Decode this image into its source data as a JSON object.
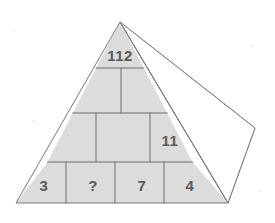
{
  "figure": {
    "type": "number-pyramid",
    "fill_color": "#dcdcdc",
    "line_color": "#6e6e6e",
    "text_color": "#5a5a5a",
    "background_color": "#ffffff"
  },
  "pyramid": {
    "rows": [
      {
        "row_index": 1,
        "name": "apex-row",
        "cells": [
          {
            "id": "r1c1",
            "label": "112"
          }
        ]
      },
      {
        "row_index": 2,
        "name": "second-row",
        "cells": [
          {
            "id": "r2c1",
            "label": ""
          },
          {
            "id": "r2c2",
            "label": ""
          }
        ]
      },
      {
        "row_index": 3,
        "name": "third-row",
        "cells": [
          {
            "id": "r3c1",
            "label": ""
          },
          {
            "id": "r3c2",
            "label": ""
          },
          {
            "id": "r3c3",
            "label": "11"
          }
        ]
      },
      {
        "row_index": 4,
        "name": "base-row",
        "cells": [
          {
            "id": "r4c1",
            "label": "3"
          },
          {
            "id": "r4c2",
            "label": "?"
          },
          {
            "id": "r4c3",
            "label": "7"
          },
          {
            "id": "r4c4",
            "label": "4"
          }
        ]
      }
    ],
    "labels": {
      "apex": "112",
      "third_row_right": "11",
      "base_1": "3",
      "base_2": "?",
      "base_3": "7",
      "base_4": "4"
    }
  },
  "side_face": {
    "name": "pyramid-side-face",
    "filled": false
  }
}
